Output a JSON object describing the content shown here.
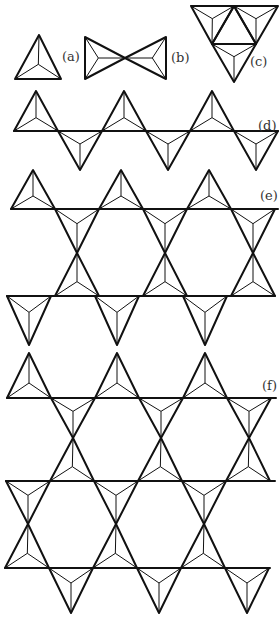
{
  "figure": {
    "stroke_color": "#111111",
    "background": "#ffffff",
    "panels": [
      {
        "id": "a",
        "label": "(a)",
        "label_pos": [
          62,
          50
        ],
        "triangles": [
          [
            [
              39,
              35
            ],
            [
              15,
              79
            ],
            [
              61,
              79
            ]
          ]
        ]
      },
      {
        "id": "b",
        "label": "(b)",
        "label_pos": [
          171,
          51
        ],
        "triangles": [
          [
            [
              85,
              37
            ],
            [
              85,
              79
            ],
            [
              125,
              58
            ]
          ],
          [
            [
              166,
              37
            ],
            [
              166,
              79
            ],
            [
              125,
              58
            ]
          ]
        ]
      },
      {
        "id": "c",
        "label": "(c)",
        "label_pos": [
          250,
          55
        ],
        "triangles": [
          [
            [
              191,
              6
            ],
            [
              234,
              6
            ],
            [
              212,
              44
            ]
          ],
          [
            [
              234,
              6
            ],
            [
              278,
              6
            ],
            [
              256,
              44
            ]
          ],
          [
            [
              212,
              44
            ],
            [
              256,
              44
            ],
            [
              234,
              82
            ]
          ]
        ],
        "inner_triangle": [
          [
            212,
            44
          ],
          [
            256,
            44
          ],
          [
            234,
            6
          ]
        ]
      },
      {
        "id": "d",
        "label": "(d)",
        "label_pos": [
          258,
          119
        ],
        "rows": [
          {
            "line_y": 131,
            "x0": 14,
            "x1": 278,
            "up_apex_y": 91,
            "down_apex_y": 170,
            "start_x": 14,
            "period": 88,
            "count_up": 3,
            "count_down": 3
          }
        ]
      },
      {
        "id": "e",
        "label": "(e)",
        "label_pos": [
          260,
          189
        ],
        "sheet": {
          "top_apex_y": 170,
          "line1_y": 209,
          "mid_y": 253,
          "line2_y": 296,
          "bottom_apex_y": 345,
          "x_start": 11,
          "period": 88
        }
      },
      {
        "id": "f",
        "label": "(f)",
        "label_pos": [
          262,
          379
        ],
        "sheet": {
          "top_apex_y": 353,
          "line1_y": 398,
          "mid1_y": 438,
          "line2_y": 481,
          "mid2_y": 524,
          "line3_y": 568,
          "bottom_apex_y": 613,
          "x_start": 7,
          "period": 88
        }
      }
    ]
  }
}
